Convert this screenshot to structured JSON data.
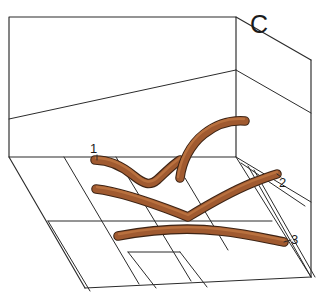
{
  "figure": {
    "panel_label": "C",
    "caption_type": "geologic-block-diagram",
    "background_color": "#ffffff",
    "line_color": "#2b2b2b"
  },
  "beds": {
    "color_fill": "#a05a30",
    "color_outline": "#3d2415",
    "color_highlight": "#b9713f",
    "items": [
      {
        "id": "bed-1",
        "label": "1"
      },
      {
        "id": "bed-2",
        "label": "2"
      },
      {
        "id": "bed-3",
        "label": "3"
      }
    ]
  },
  "block": {
    "front_face_name": "front-face",
    "top_face_name": "top-face",
    "right_face_name": "right-face",
    "base_face_name": "base-face"
  }
}
